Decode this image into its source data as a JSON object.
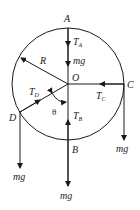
{
  "diagram": {
    "type": "free-body-diagram",
    "colors": {
      "stroke": "#1a1a1a",
      "background": "#ffffff"
    },
    "center": {
      "label": "O"
    },
    "radius_label": "R",
    "angle_label": "θ",
    "points": [
      {
        "id": "A",
        "label": "A",
        "tension": "T",
        "tension_sub": "A",
        "gravity": "mg"
      },
      {
        "id": "B",
        "label": "B",
        "tension": "T",
        "tension_sub": "B",
        "gravity": "mg"
      },
      {
        "id": "C",
        "label": "C",
        "tension": "T",
        "tension_sub": "C",
        "gravity": "mg"
      },
      {
        "id": "D",
        "label": "D",
        "tension": "T",
        "tension_sub": "D",
        "gravity": "mg"
      }
    ]
  }
}
